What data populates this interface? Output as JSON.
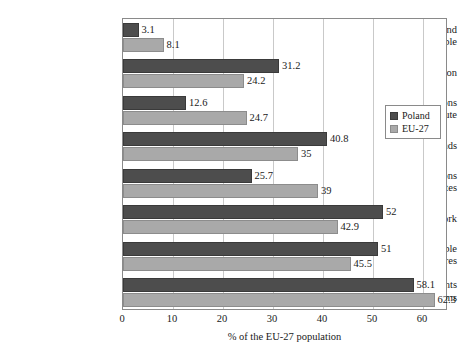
{
  "chart_data": {
    "type": "bar",
    "orientation": "horizontal",
    "title": "",
    "xlabel": "% of the EU-27 population",
    "ylabel": "",
    "xlim": [
      0,
      65
    ],
    "xticks": [
      0,
      10,
      20,
      30,
      40,
      50,
      60
    ],
    "grid": true,
    "legend_position": "right",
    "categories": [
      "Lifting and\nmoving people",
      "Vibration",
      "Repetitive actions\nshorter than 1 minute",
      "Lifting heavy loads",
      "Repetitive actions\nshorter than 10 minutes",
      "Monotonous work",
      "Uncomfortable\nbody postures",
      "Repetitive movements\nof hands and arms"
    ],
    "series": [
      {
        "name": "Poland",
        "color": "#4d4d4d",
        "values": [
          3.1,
          31.2,
          12.6,
          40.8,
          25.7,
          52,
          51,
          58.1
        ],
        "labels": [
          "3.1",
          "31.2",
          "12.6",
          "40.8",
          "25.7",
          "52",
          "51",
          "58.1"
        ]
      },
      {
        "name": "EU-27",
        "color": "#a9a9a9",
        "values": [
          8.1,
          24.2,
          24.7,
          35,
          39,
          42.9,
          45.5,
          62.3
        ],
        "labels": [
          "8.1",
          "24.2",
          "24.7",
          "35",
          "39",
          "42.9",
          "45.5",
          "62.3"
        ]
      }
    ]
  },
  "legend": {
    "items": [
      {
        "label": "Poland"
      },
      {
        "label": "EU-27"
      }
    ]
  }
}
